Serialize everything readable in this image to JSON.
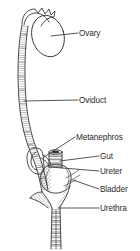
{
  "figure": {
    "background_color": "#ffffff",
    "ink_color": "#2b2b2b",
    "label_color": "#2b2b2b"
  },
  "labels": [
    {
      "id": "ovary",
      "text": "Ovary",
      "x": 79,
      "y": 29
    },
    {
      "id": "oviduct",
      "text": "Oviduct",
      "x": 79,
      "y": 96
    },
    {
      "id": "metanephros",
      "text": "Metanephros",
      "x": 76,
      "y": 133
    },
    {
      "id": "gut",
      "text": "Gut",
      "x": 100,
      "y": 152
    },
    {
      "id": "ureter",
      "text": "Ureter",
      "x": 100,
      "y": 167
    },
    {
      "id": "bladder",
      "text": "Bladder",
      "x": 100,
      "y": 185
    },
    {
      "id": "urethra",
      "text": "Urethra",
      "x": 100,
      "y": 204
    }
  ],
  "structures": [
    {
      "id": "ostium",
      "name": "ostium-infundibulum"
    },
    {
      "id": "ovary",
      "name": "ovary-oval"
    },
    {
      "id": "oviduct",
      "name": "oviduct-tube"
    },
    {
      "id": "metanephros",
      "name": "metanephros-kidney"
    },
    {
      "id": "gut",
      "name": "gut-tube"
    },
    {
      "id": "ureter",
      "name": "ureter-duct"
    },
    {
      "id": "bladder",
      "name": "bladder-sac"
    },
    {
      "id": "urethra",
      "name": "urethra-tube"
    }
  ],
  "leader_lines": [
    {
      "id": "ovary-leader",
      "from": [
        54,
        36
      ],
      "to": [
        78,
        33
      ]
    },
    {
      "id": "oviduct-leader",
      "from": [
        24,
        101
      ],
      "to": [
        78,
        100
      ]
    },
    {
      "id": "metanephros-leader",
      "from": [
        46,
        156
      ],
      "to": [
        75,
        137
      ]
    },
    {
      "id": "gut-leader",
      "from": [
        62,
        163
      ],
      "to": [
        99,
        156
      ]
    },
    {
      "id": "ureter-leader",
      "from": [
        52,
        168
      ],
      "to": [
        99,
        171
      ]
    },
    {
      "id": "bladder-leader",
      "from": [
        72,
        181
      ],
      "to": [
        99,
        189
      ]
    },
    {
      "id": "urethra-leader",
      "from": [
        60,
        208
      ],
      "to": [
        99,
        208
      ]
    }
  ]
}
